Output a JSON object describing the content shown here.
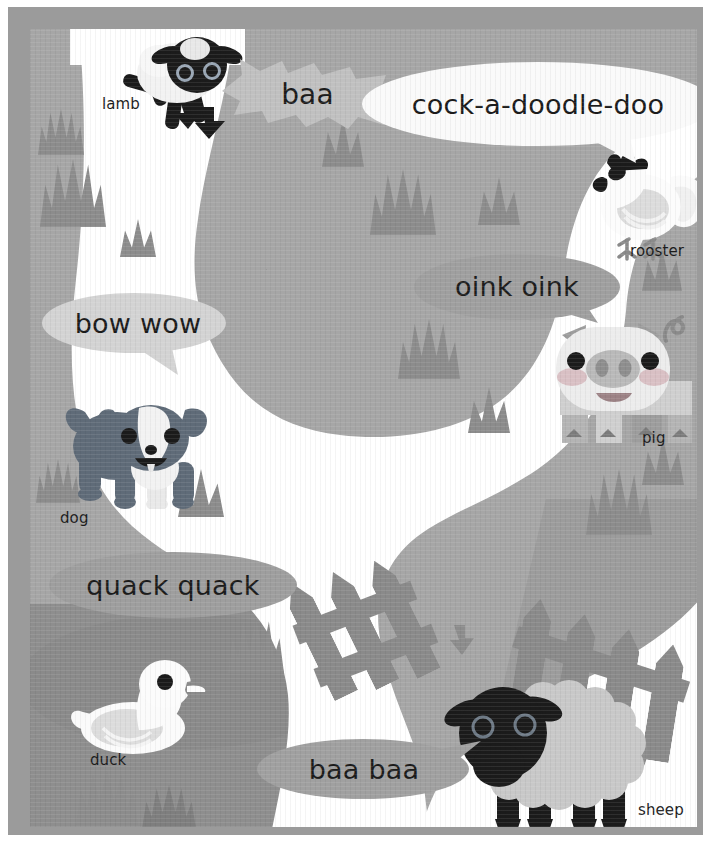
{
  "scene": {
    "title": "Farm Animals Picture Page",
    "kind": "childrens-book-illustration",
    "background_color": "#a6a6a6",
    "frame_color": "#9b9b9b",
    "path_color": "#ffffff",
    "grass_color": "#8c8c8c",
    "pond_color": "#8a8a8a",
    "ink_color": "#1b1b1b"
  },
  "animals": [
    {
      "id": "lamb",
      "label": "lamb",
      "sound": "baa"
    },
    {
      "id": "rooster",
      "label": "rooster",
      "sound": "cock-a-doodle-doo"
    },
    {
      "id": "pig",
      "label": "pig",
      "sound": "oink oink"
    },
    {
      "id": "dog",
      "label": "dog",
      "sound": "bow wow"
    },
    {
      "id": "duck",
      "label": "duck",
      "sound": "quack quack"
    },
    {
      "id": "sheep",
      "label": "sheep",
      "sound": "baa baa"
    }
  ],
  "labels": {
    "lamb": "lamb",
    "rooster": "rooster",
    "pig": "pig",
    "dog": "dog",
    "duck": "duck",
    "sheep": "sheep"
  },
  "bubbles": {
    "baa": "baa",
    "cock_a_doodle_doo": "cock-a-doodle-doo",
    "oink_oink": "oink oink",
    "bow_wow": "bow wow",
    "quack_quack": "quack quack",
    "baa_baa": "baa baa"
  }
}
